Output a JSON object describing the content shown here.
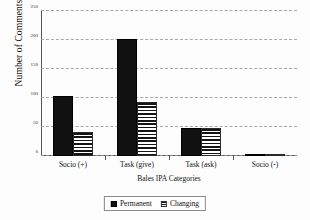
{
  "chart_data": {
    "type": "bar",
    "title": "",
    "xlabel": "Bales IPA Categories",
    "ylabel": "Number of Comments",
    "categories": [
      "Socio  (+)",
      "Task (give)",
      "Task (ask)",
      "Socio (-)"
    ],
    "series": [
      {
        "name": "Permanent",
        "values": [
          103,
          202,
          48,
          4
        ]
      },
      {
        "name": "Changing",
        "values": [
          41,
          93,
          48,
          1
        ]
      }
    ],
    "ylim": [
      0,
      250
    ],
    "yticks": [
      0,
      50,
      100,
      150,
      200,
      250
    ],
    "ytick_labels": [
      "0",
      "50",
      "100",
      "150",
      "200",
      "250"
    ],
    "grid": "horizontal-dashed",
    "legend_position": "bottom",
    "colors": {
      "permanent": "#111111",
      "changing_stripe": "#141414",
      "changing_background": "#ffffff",
      "gridline": "#9a9a9a",
      "axis": "#555555",
      "figure_background": "#fdfdfd"
    }
  },
  "legend": {
    "items": [
      {
        "label": "Permanent",
        "pattern": "solid"
      },
      {
        "label": "Changing",
        "pattern": "horizontal-stripes"
      }
    ]
  }
}
